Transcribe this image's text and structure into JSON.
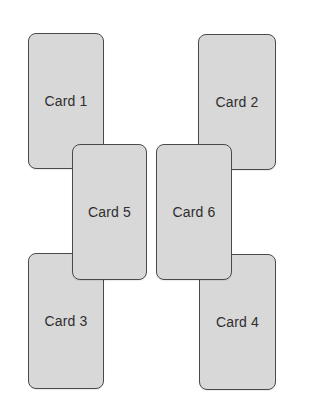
{
  "cards": [
    {
      "id": "card-1",
      "label": "Card 1"
    },
    {
      "id": "card-2",
      "label": "Card 2"
    },
    {
      "id": "card-3",
      "label": "Card 3"
    },
    {
      "id": "card-4",
      "label": "Card 4"
    },
    {
      "id": "card-5",
      "label": "Card 5"
    },
    {
      "id": "card-6",
      "label": "Card 6"
    }
  ],
  "colors": {
    "card_fill": "#d8d8d8",
    "card_border": "#4a4a4a",
    "label_text": "#2e2e2e",
    "background": "#ffffff"
  }
}
